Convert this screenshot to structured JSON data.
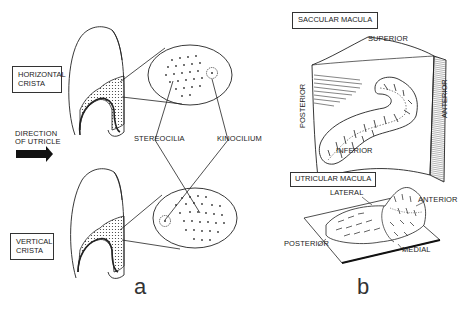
{
  "figure": {
    "panel_a": {
      "letter": "a",
      "labels": {
        "horizontal_crista": [
          "HORIZONTAL",
          "CRISTA"
        ],
        "direction": [
          "DIRECTION",
          "OF UTRICLE"
        ],
        "vertical_crista": [
          "VERTICAL",
          "CRISTA"
        ],
        "stereocilia": "STEREOCILIA",
        "kinocilium": "KINOCILIUM"
      }
    },
    "panel_b": {
      "letter": "b",
      "saccular": {
        "title": "SACCULAR MACULA",
        "superior": "SUPERIOR",
        "inferior": "INFERIOR",
        "posterior": "POSTERIOR",
        "anterior": "ANTERIOR"
      },
      "utricular": {
        "title": "UTRICULAR MACULA",
        "lateral": "LATERAL",
        "anterior": "ANTERIOR",
        "posterior": "POSTERIOR",
        "medial": "MEDIAL"
      }
    }
  }
}
